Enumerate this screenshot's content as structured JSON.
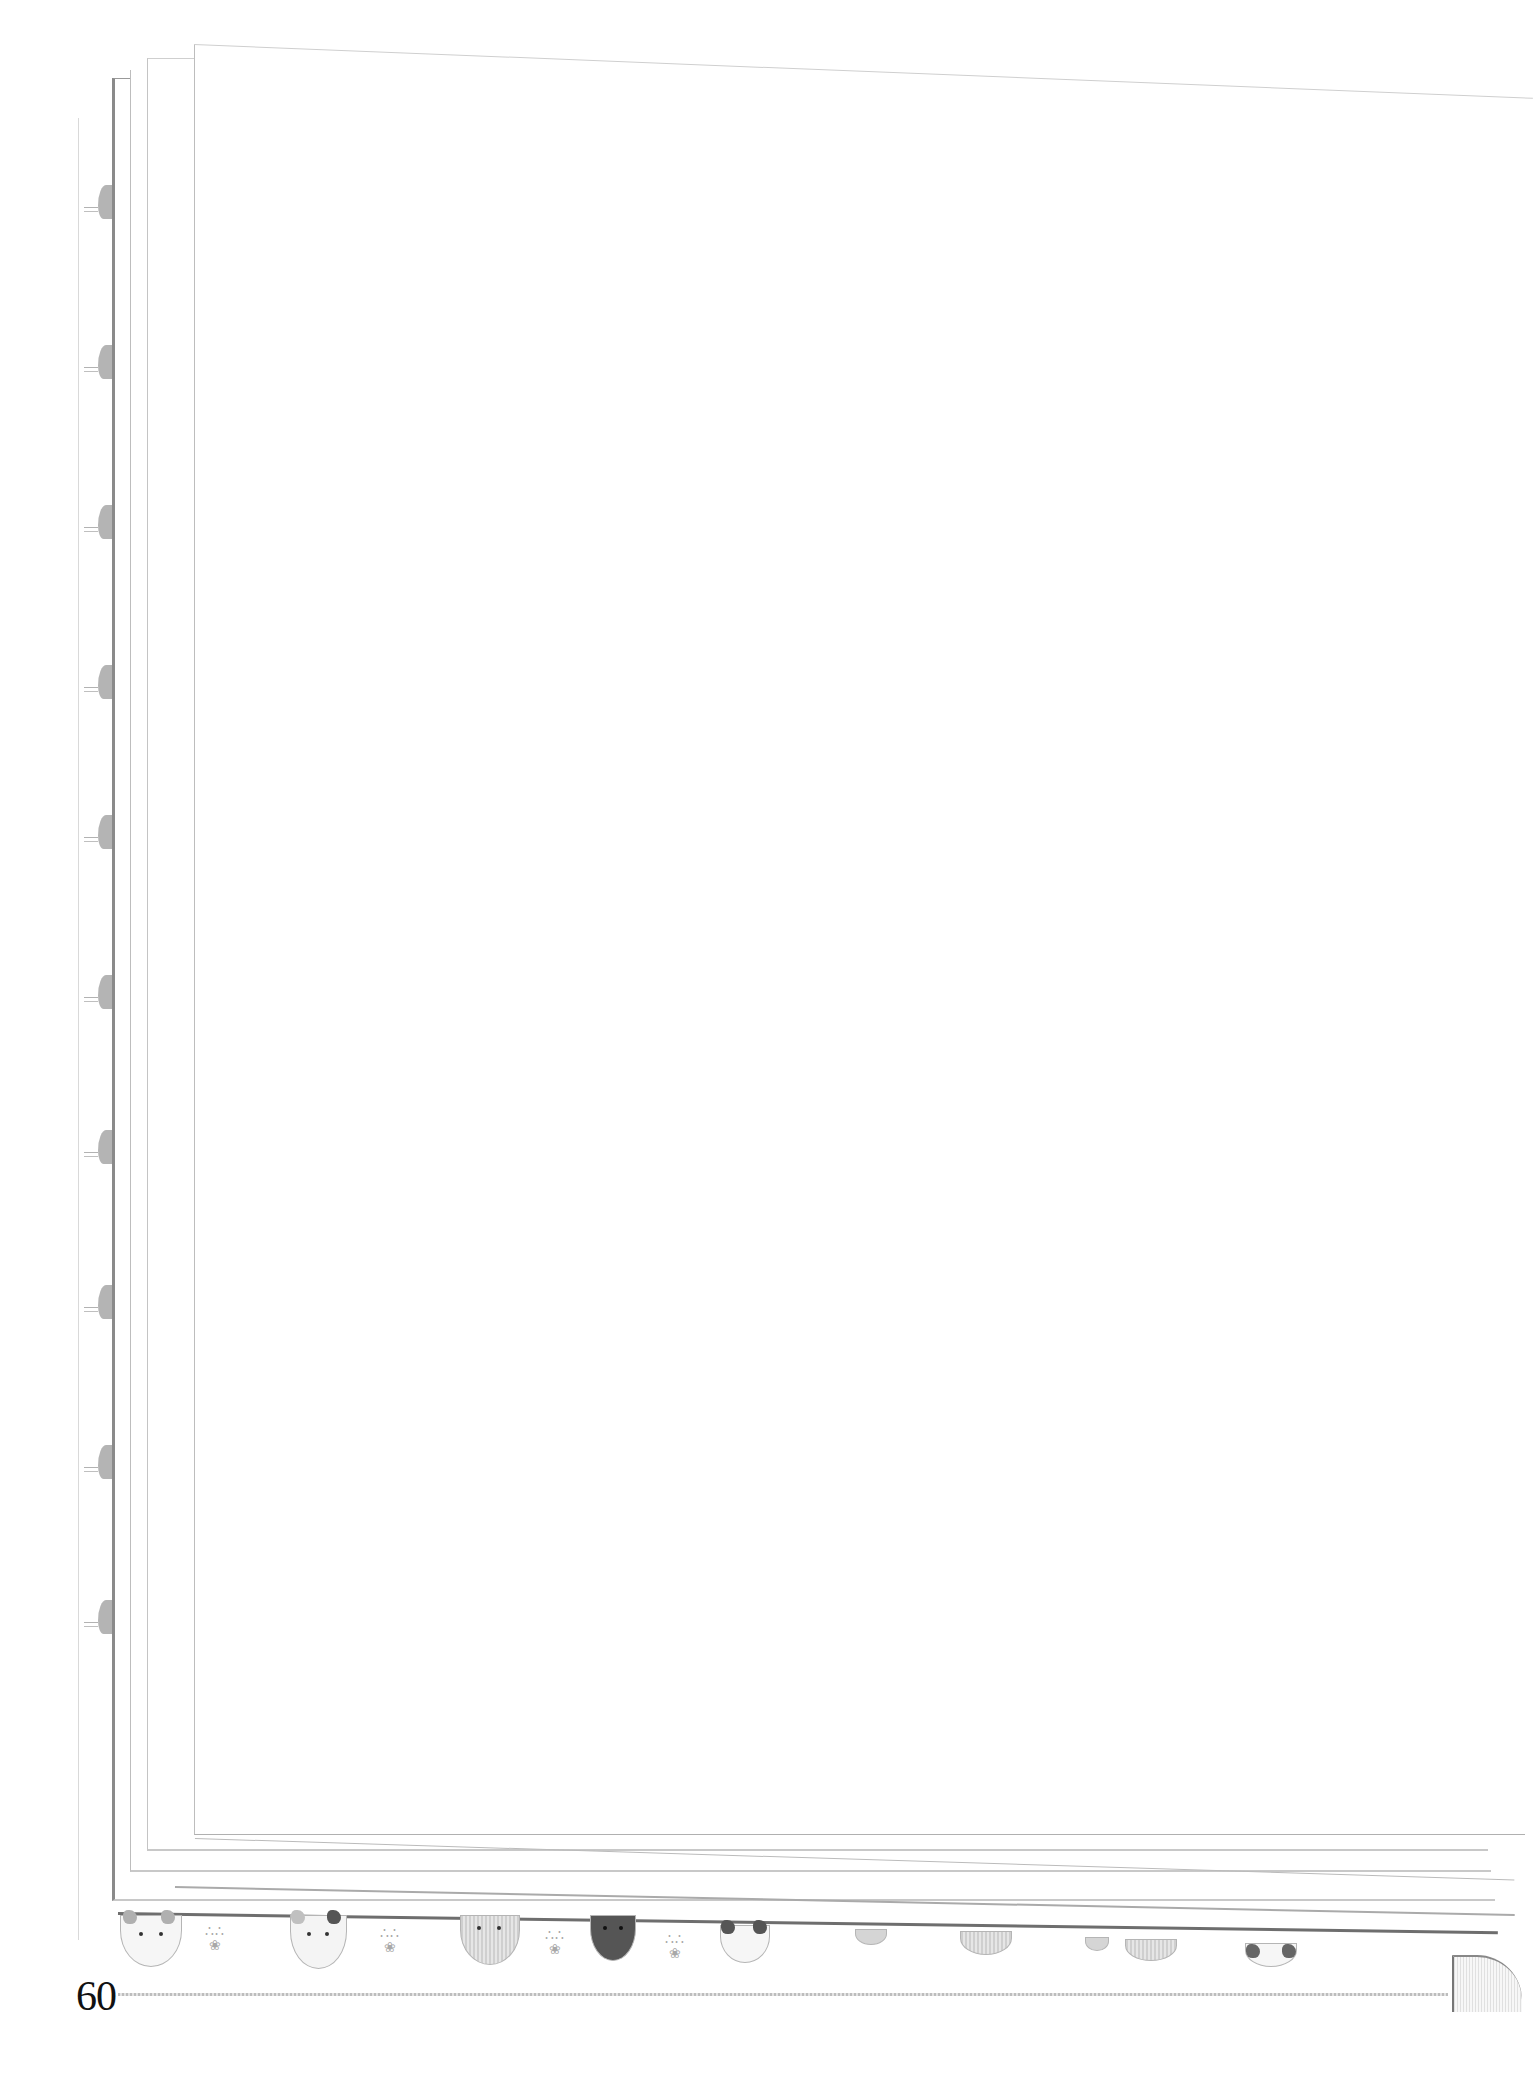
{
  "page": {
    "number": "60",
    "body_text": ""
  },
  "decorations": {
    "bottom_strip": [
      {
        "type": "cat-face",
        "style": "calico white with grey patches"
      },
      {
        "type": "paw-prints"
      },
      {
        "type": "cat-face",
        "style": "white with dark patch"
      },
      {
        "type": "paw-prints"
      },
      {
        "type": "cat-face",
        "style": "grey striped"
      },
      {
        "type": "paw-prints"
      },
      {
        "type": "cat-face",
        "style": "dark grey"
      },
      {
        "type": "paw-prints"
      },
      {
        "type": "cat-face",
        "style": "white with dark ears"
      },
      {
        "type": "cat-face",
        "style": "small grey, partially hidden"
      },
      {
        "type": "cat-face",
        "style": "striped, partially hidden"
      },
      {
        "type": "cat-face",
        "style": "small, partially hidden"
      },
      {
        "type": "cat-face",
        "style": "striped, partially hidden"
      },
      {
        "type": "cat-face",
        "style": "white with dark ears, partially hidden"
      }
    ],
    "left_edge_cats": 10
  },
  "colors": {
    "paper": "#ffffff",
    "edge_line": "#8a8a8a",
    "page_number": "#111111"
  }
}
